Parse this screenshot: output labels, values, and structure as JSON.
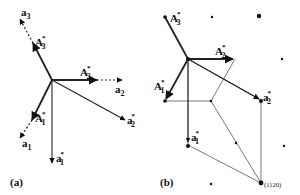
{
  "figure": {
    "panels": [
      {
        "id": "a",
        "label": "(a)",
        "origin": [
          52,
          80
        ],
        "vectors": [
          {
            "name": "A3*",
            "base": "A",
            "sub": "3",
            "star": true,
            "style": "solid-thick",
            "end": [
              33,
              43
            ]
          },
          {
            "name": "a3",
            "base": "a",
            "sub": "3",
            "star": false,
            "style": "dashed",
            "end": [
              20,
              19
            ]
          },
          {
            "name": "A2*",
            "base": "A",
            "sub": "2",
            "star": true,
            "style": "solid-thick",
            "end": [
              97,
              80
            ]
          },
          {
            "name": "a2",
            "base": "a",
            "sub": "2",
            "star": false,
            "style": "dashed",
            "end": [
              122,
              80
            ]
          },
          {
            "name": "A1*",
            "base": "A",
            "sub": "1",
            "star": true,
            "style": "solid-thick",
            "end": [
              32,
              120
            ]
          },
          {
            "name": "a1",
            "base": "a",
            "sub": "1",
            "star": false,
            "style": "dashed",
            "end": [
              20,
              138
            ]
          },
          {
            "name": "a1*",
            "base": "a",
            "sub": "1",
            "star": true,
            "style": "solid-thin",
            "end": [
              52,
              163
            ]
          },
          {
            "name": "a2*",
            "base": "a",
            "sub": "2",
            "star": true,
            "style": "solid-thin",
            "end": [
              125,
              120
            ]
          }
        ]
      },
      {
        "id": "b",
        "label": "(b)",
        "origin": [
          188,
          59
        ],
        "vectors": [
          {
            "name": "A3*",
            "base": "A",
            "sub": "3",
            "star": true,
            "end": [
              165,
              17
            ]
          },
          {
            "name": "A2*",
            "base": "A",
            "sub": "2",
            "star": true,
            "end": [
              235,
              59
            ]
          },
          {
            "name": "A1*",
            "base": "A",
            "sub": "1",
            "star": true,
            "end": [
              165,
              101
            ]
          },
          {
            "name": "a1*",
            "base": "a",
            "sub": "1",
            "star": true,
            "end": [
              188,
              145
            ]
          },
          {
            "name": "a2*",
            "base": "a",
            "sub": "2",
            "star": true,
            "end": [
              261,
              100
            ]
          }
        ],
        "reflection_label": "(11̅2̅0)",
        "reflection_text": "(1120)",
        "reflection_point": [
          261,
          183
        ],
        "lattice_points": [
          [
            212,
            17
          ],
          [
            259,
            16
          ],
          [
            282,
            59
          ],
          [
            284,
            146
          ],
          [
            211,
            184
          ]
        ]
      }
    ]
  }
}
